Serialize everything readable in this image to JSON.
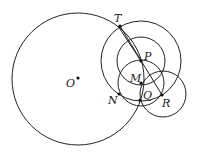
{
  "diagram": {
    "type": "geometry-figure",
    "colors": {
      "stroke": "#222222",
      "point": "#111111",
      "background": "#ffffff"
    },
    "circles": [
      {
        "id": "circle-O",
        "cx": 78,
        "cy": 79,
        "r": 66
      },
      {
        "id": "circle-P-large",
        "cx": 141,
        "cy": 61,
        "r": 40
      },
      {
        "id": "circle-P-small",
        "cx": 141,
        "cy": 61,
        "r": 24
      },
      {
        "id": "circle-M",
        "cx": 141,
        "cy": 83,
        "r": 23
      },
      {
        "id": "circle-R",
        "cx": 163,
        "cy": 94,
        "r": 23
      }
    ],
    "segments": [
      {
        "id": "segment-TR",
        "x1": 120,
        "y1": 26,
        "x2": 162,
        "y2": 95
      },
      {
        "id": "segment-TP",
        "x1": 118,
        "y1": 26,
        "x2": 141,
        "y2": 61
      }
    ],
    "points": [
      {
        "id": "O",
        "label": "O",
        "x": 78,
        "y": 78,
        "lx": 66,
        "ly": 87
      },
      {
        "id": "T",
        "label": "T",
        "x": 120,
        "y": 26,
        "lx": 114,
        "ly": 22
      },
      {
        "id": "P",
        "label": "P",
        "x": 141,
        "y": 61,
        "lx": 144,
        "ly": 60
      },
      {
        "id": "M",
        "label": "M",
        "x": 141,
        "y": 83,
        "lx": 130,
        "ly": 82
      },
      {
        "id": "Q",
        "label": "Q",
        "x": 140,
        "y": 100,
        "lx": 143,
        "ly": 99
      },
      {
        "id": "N",
        "label": "N",
        "x": 119,
        "y": 94,
        "lx": 108,
        "ly": 104
      },
      {
        "id": "R",
        "label": "R",
        "x": 162,
        "y": 95,
        "lx": 162,
        "ly": 107
      }
    ]
  }
}
